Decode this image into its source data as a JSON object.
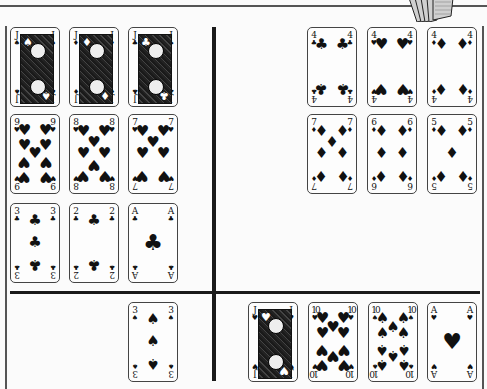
{
  "table": {
    "deck_icon": "card-fan-icon",
    "colors": {
      "background": "#fbfbfb",
      "lines": "#1a1a1a",
      "card_border": "#444444",
      "ink": "#111111"
    }
  },
  "areas": {
    "left_grid": {
      "rows": [
        [
          {
            "rank": "J",
            "suit": "♠",
            "name": "jack-of-spades",
            "face": true
          },
          {
            "rank": "J",
            "suit": "♦",
            "name": "jack-of-diamonds",
            "face": true
          },
          {
            "rank": "J",
            "suit": "♣",
            "name": "jack-of-clubs",
            "face": true
          }
        ],
        [
          {
            "rank": "9",
            "suit": "♥",
            "name": "nine-of-hearts"
          },
          {
            "rank": "8",
            "suit": "♥",
            "name": "eight-of-hearts"
          },
          {
            "rank": "7",
            "suit": "♥",
            "name": "seven-of-hearts"
          }
        ],
        [
          {
            "rank": "3",
            "suit": "♣",
            "name": "three-of-clubs"
          },
          {
            "rank": "2",
            "suit": "♣",
            "name": "two-of-clubs"
          },
          {
            "rank": "A",
            "suit": "♣",
            "name": "ace-of-clubs"
          }
        ]
      ]
    },
    "right_grid": {
      "rows": [
        [
          {
            "rank": "4",
            "suit": "♣",
            "name": "four-of-clubs"
          },
          {
            "rank": "4",
            "suit": "♥",
            "name": "four-of-hearts"
          },
          {
            "rank": "4",
            "suit": "♦",
            "name": "four-of-diamonds"
          }
        ],
        [
          {
            "rank": "7",
            "suit": "♦",
            "name": "seven-of-diamonds"
          },
          {
            "rank": "6",
            "suit": "♦",
            "name": "six-of-diamonds"
          },
          {
            "rank": "5",
            "suit": "♦",
            "name": "five-of-diamonds"
          }
        ]
      ]
    },
    "bottom_left": {
      "cards": [
        {
          "rank": "3",
          "suit": "♠",
          "name": "three-of-spades"
        }
      ]
    },
    "bottom_right": {
      "cards": [
        {
          "rank": "J",
          "suit": "♥",
          "name": "jack-of-hearts",
          "face": true
        },
        {
          "rank": "10",
          "suit": "♥",
          "name": "ten-of-hearts"
        },
        {
          "rank": "10",
          "suit": "♠",
          "name": "ten-of-spades"
        },
        {
          "rank": "A",
          "suit": "♥",
          "name": "ace-of-hearts"
        }
      ]
    }
  }
}
